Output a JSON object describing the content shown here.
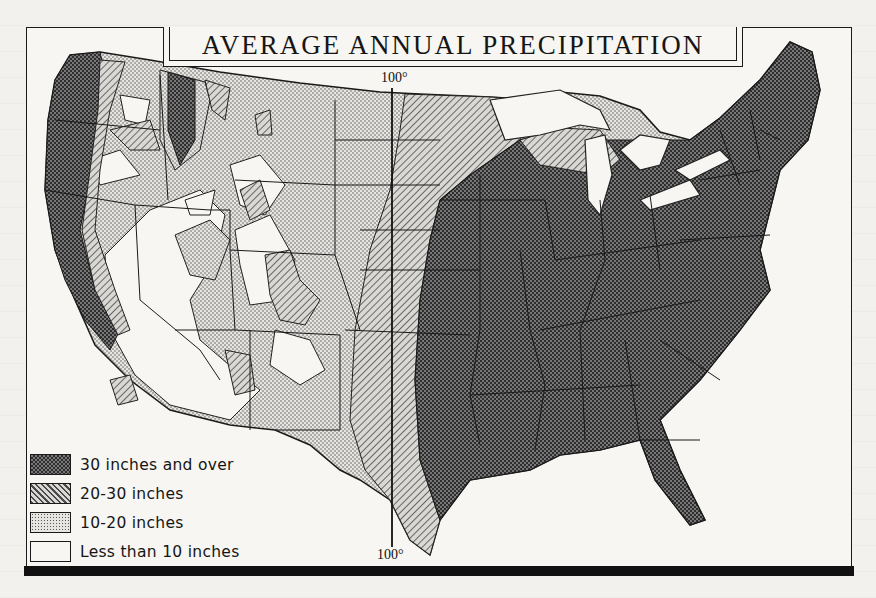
{
  "map": {
    "title": "AVERAGE ANNUAL PRECIPITATION",
    "meridian_label_top": "100°",
    "meridian_label_bottom": "100°",
    "region": "United States (contiguous)",
    "fill_styles": {
      "over_30": {
        "pattern": "dense-checker",
        "color": "#5a5a5a"
      },
      "20_30": {
        "pattern": "diagonal-hatch",
        "color": "#8c8c8c"
      },
      "10_20": {
        "pattern": "stipple",
        "color": "#c9c9c6"
      },
      "under_10": {
        "pattern": "none",
        "color": "#f7f6f2"
      }
    }
  },
  "legend": {
    "items": [
      {
        "label": "30 inches and over",
        "category": "over_30"
      },
      {
        "label": "20-30 inches",
        "category": "20_30"
      },
      {
        "label": "10-20 inches",
        "category": "10_20"
      },
      {
        "label": "Less than 10 inches",
        "category": "under_10"
      }
    ]
  }
}
